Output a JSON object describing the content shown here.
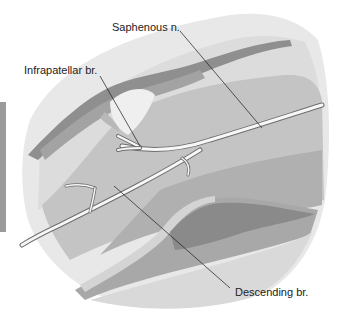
{
  "figure": {
    "type": "anatomical-illustration",
    "labels": [
      {
        "id": "saphenous",
        "text": "Saphenous n."
      },
      {
        "id": "infrapatellar",
        "text": "Infrapatellar br."
      },
      {
        "id": "descending",
        "text": "Descending br."
      }
    ],
    "colors": {
      "background": "#ffffff",
      "skin_outer": "#e6e6e6",
      "skin_light": "#d6d6d6",
      "mid_gray": "#bdbdbd",
      "dark_band": "#8f8f8f",
      "muscle_gray": "#a6a6a6",
      "nerve": "#f7f7f7",
      "leader_line": "#1a1a1a",
      "side_bar": "#9a9a9a"
    }
  }
}
